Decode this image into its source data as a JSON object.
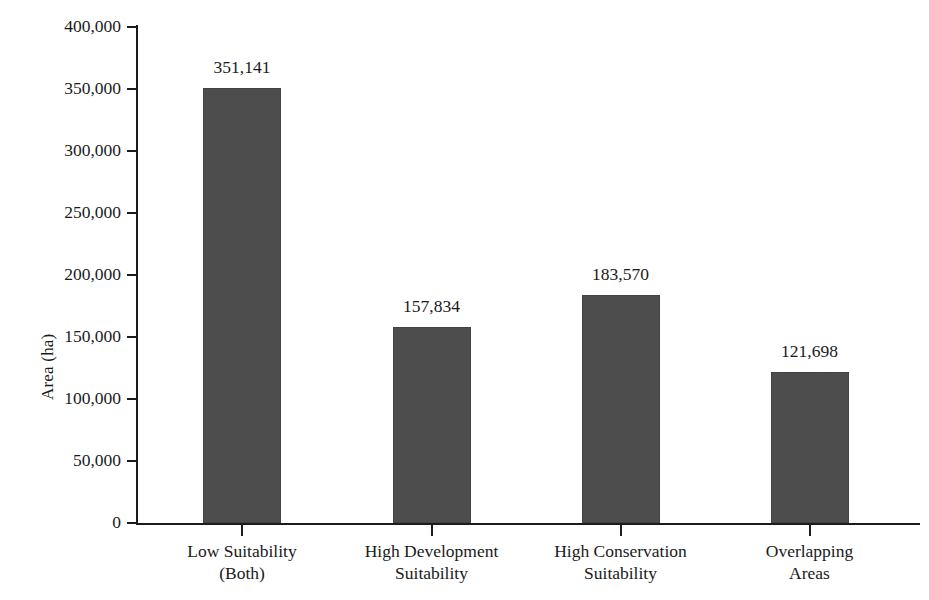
{
  "chart_data": {
    "type": "bar",
    "title": "",
    "subtitle": "",
    "xlabel": "",
    "ylabel": "Area (ha)",
    "ylim": [
      0,
      400000
    ],
    "ytick_step": 50000,
    "grid": false,
    "legend": null,
    "bar_color": "#4d4d4d",
    "axis_color": "#1c1c1c",
    "text_color": "#1a1a1a",
    "background": "#ffffff",
    "value_label_format": "comma-separated integer",
    "categories": [
      "Low Suitability (Both)",
      "High Development Suitability",
      "High Conservation Suitability",
      "Overlapping Areas"
    ],
    "category_lines": [
      [
        "Low Suitability",
        "(Both)"
      ],
      [
        "High Development",
        "Suitability"
      ],
      [
        "High Conservation",
        "Suitability"
      ],
      [
        "Overlapping",
        "Areas"
      ]
    ],
    "values": [
      351141,
      157834,
      183570,
      121698
    ],
    "value_labels": [
      "351,141",
      "157,834",
      "183,570",
      "121,698"
    ],
    "ytick_labels": [
      "400,000",
      "350,000",
      "300,000",
      "250,000",
      "200,000",
      "150,000",
      "100,000",
      "50,000",
      "0"
    ],
    "ytick_values": [
      400000,
      350000,
      300000,
      250000,
      200000,
      150000,
      100000,
      50000,
      0
    ]
  }
}
